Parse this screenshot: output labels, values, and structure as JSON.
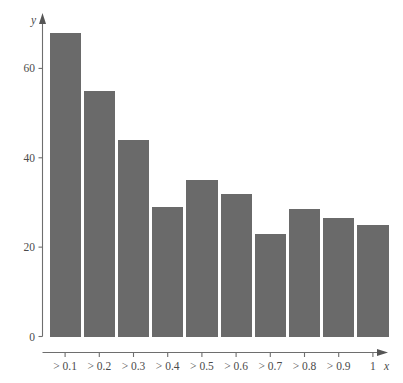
{
  "chart_data": {
    "type": "bar",
    "title": "",
    "subtitle": "",
    "xlabel": "x",
    "ylabel": "y",
    "categories": [
      "> 0.1",
      "> 0.2",
      "> 0.3",
      "> 0.4",
      "> 0.5",
      "> 0.6",
      "> 0.7",
      "> 0.8",
      "> 0.9",
      "1"
    ],
    "values": [
      68,
      55,
      44,
      29,
      35,
      32,
      23,
      28.5,
      26.5,
      25
    ],
    "xlim": [
      0,
      10
    ],
    "ylim": [
      0,
      72
    ],
    "y_ticks": [
      0,
      20,
      40,
      60
    ],
    "y_tick_labels": [
      "0",
      "20",
      "40",
      "60"
    ],
    "grid": false,
    "legend": null,
    "bar_color": "#6a6a6a",
    "background_color": "#ffffff",
    "axis_color": "#6e6e6e",
    "text_color": "#4b4b4b"
  },
  "axes": {
    "y_axis_label": "y",
    "x_axis_label": "x"
  }
}
